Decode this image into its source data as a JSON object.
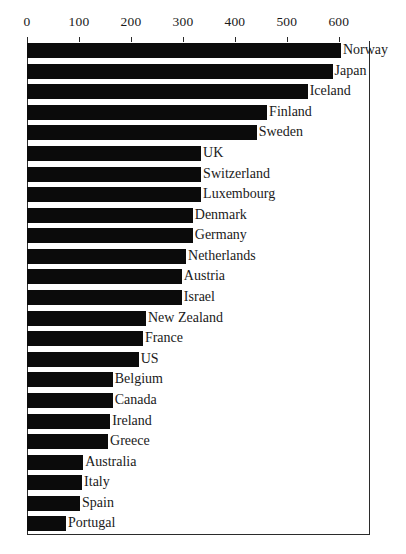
{
  "chart_data": {
    "type": "bar",
    "orientation": "horizontal",
    "title": "",
    "subtitle": "",
    "xlabel": "",
    "ylabel": "",
    "xlim": [
      0,
      660
    ],
    "xticks": [
      0,
      100,
      200,
      300,
      400,
      500,
      600
    ],
    "xtick_labels": [
      "0",
      "100",
      "200",
      "300",
      "400",
      "500",
      "600"
    ],
    "grid": false,
    "legend": null,
    "axis_position": "top",
    "bar_color": "#0b0b0b",
    "categories": [
      "Norway",
      "Japan",
      "Iceland",
      "Finland",
      "Sweden",
      "UK",
      "Switzerland",
      "Luxembourg",
      "Denmark",
      "Germany",
      "Netherlands",
      "Austria",
      "Israel",
      "New Zealand",
      "France",
      "US",
      "Belgium",
      "Canada",
      "Ireland",
      "Greece",
      "Australia",
      "Italy",
      "Spain",
      "Portugal"
    ],
    "values": [
      604,
      588,
      540,
      462,
      442,
      335,
      335,
      335,
      319,
      319,
      306,
      298,
      298,
      229,
      223,
      215,
      165,
      165,
      160,
      156,
      108,
      106,
      102,
      75
    ]
  }
}
